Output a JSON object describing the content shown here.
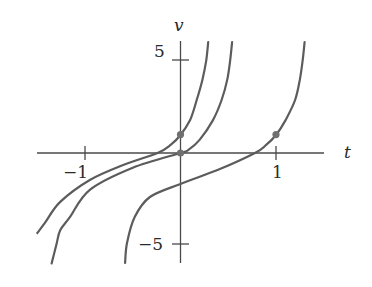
{
  "chart_data": {
    "type": "line",
    "title": "",
    "xlabel": "t",
    "ylabel": "v",
    "xlim": [
      -1.5,
      1.5
    ],
    "ylim": [
      -6,
      6
    ],
    "grid": false,
    "legend": null,
    "x_ticks": [
      {
        "value": -1,
        "label": "−1"
      },
      {
        "value": 1,
        "label": "1"
      }
    ],
    "y_ticks": [
      {
        "value": 5,
        "label": "5"
      },
      {
        "value": -5,
        "label": "−5"
      }
    ],
    "series": [
      {
        "name": "solution through (0, 1)",
        "points": [
          [
            -1.5,
            -4.35
          ],
          [
            -1.42,
            -3.8
          ],
          [
            -1.26,
            -2.66
          ],
          [
            -0.95,
            -1.47
          ],
          [
            -0.6,
            -0.65
          ],
          [
            -0.24,
            0
          ],
          [
            -0.1,
            0.45
          ],
          [
            0,
            0.98
          ],
          [
            0.1,
            1.79
          ],
          [
            0.17,
            2.88
          ],
          [
            0.23,
            4.0
          ],
          [
            0.27,
            5.05
          ],
          [
            0.29,
            6.03
          ]
        ]
      },
      {
        "name": "solution through (0, 0)",
        "points": [
          [
            -1.35,
            -6.0
          ],
          [
            -1.3,
            -5.0
          ],
          [
            -1.26,
            -4.2
          ],
          [
            -1.16,
            -3.5
          ],
          [
            -0.95,
            -2.0
          ],
          [
            -0.5,
            -0.8
          ],
          [
            0,
            0
          ],
          [
            0.08,
            0.16
          ],
          [
            0.2,
            0.71
          ],
          [
            0.34,
            1.79
          ],
          [
            0.43,
            2.88
          ],
          [
            0.49,
            4.0
          ],
          [
            0.52,
            5.05
          ],
          [
            0.54,
            6.03
          ]
        ]
      },
      {
        "name": "solution through (1, 1)",
        "points": [
          [
            -0.58,
            -5.98
          ],
          [
            -0.56,
            -4.89
          ],
          [
            -0.48,
            -3.48
          ],
          [
            -0.32,
            -2.39
          ],
          [
            0,
            -1.68
          ],
          [
            0.4,
            -0.9
          ],
          [
            0.78,
            0
          ],
          [
            0.9,
            0.45
          ],
          [
            1.0,
            0.98
          ],
          [
            1.1,
            1.79
          ],
          [
            1.2,
            2.88
          ],
          [
            1.25,
            4.0
          ],
          [
            1.28,
            5.05
          ],
          [
            1.3,
            6.03
          ]
        ]
      }
    ],
    "marked_points": [
      {
        "t": 0,
        "v": 1
      },
      {
        "t": 0,
        "v": 0
      },
      {
        "t": 1,
        "v": 1
      }
    ]
  },
  "labels": {
    "x_axis": "t",
    "y_axis": "v",
    "tick_neg1": "−1",
    "tick_1": "1",
    "tick_5": "5",
    "tick_neg5": "−5"
  }
}
